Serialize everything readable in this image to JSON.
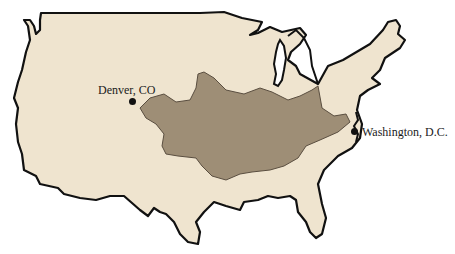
{
  "map": {
    "type": "outline map",
    "region": "Contiguous United States",
    "colors": {
      "land": "#efe4cf",
      "outline": "#111111",
      "shaded_region": "#9e8e76",
      "shaded_outline": "#5a4e40",
      "lakes": "#ffffff",
      "background": "#ffffff"
    },
    "cities": [
      {
        "name": "Denver, CO",
        "x": 132,
        "y": 101
      },
      {
        "name": "Washington, D.C.",
        "x": 355,
        "y": 132
      }
    ]
  }
}
